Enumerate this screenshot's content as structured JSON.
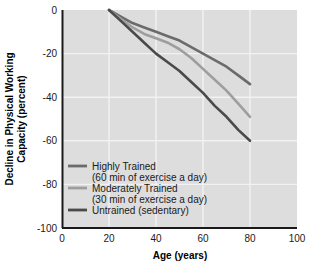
{
  "chart_data": {
    "type": "line",
    "title": "",
    "xlabel": "Age (years)",
    "ylabel": "Decline in Physical Working Capacity (percent)",
    "ylabel_line1": "Decline in Physical Working",
    "ylabel_line2": "Capacity (percent)",
    "xlim": [
      0,
      100
    ],
    "ylim": [
      -100,
      0
    ],
    "xticks": [
      "0",
      "20",
      "40",
      "60",
      "80",
      "100"
    ],
    "yticks": [
      "0",
      "-20",
      "-40",
      "-60",
      "-80",
      "-100"
    ],
    "grid": "white gridlines on gray panel",
    "legend_position": "inside lower left",
    "panel_color": "#dddddd",
    "gridline_color": "#f5f5f5",
    "axis_color": "#1a1a1a",
    "series": [
      {
        "name": "Highly Trained",
        "sublabel": "(60 min of exercise a day)",
        "color": "#6b6b6b",
        "x": [
          20,
          25,
          30,
          35,
          40,
          45,
          50,
          55,
          60,
          65,
          70,
          75,
          80
        ],
        "values": [
          0,
          -3,
          -6,
          -8,
          -10,
          -12,
          -14,
          -17,
          -20,
          -23,
          -26,
          -30,
          -34
        ]
      },
      {
        "name": "Moderately Trained",
        "sublabel": "(30 min of exercise a day)",
        "color": "#9e9e9e",
        "x": [
          20,
          25,
          30,
          35,
          40,
          45,
          50,
          55,
          60,
          65,
          70,
          75,
          80
        ],
        "values": [
          0,
          -4,
          -8,
          -11,
          -13,
          -15,
          -18,
          -22,
          -27,
          -32,
          -37,
          -43,
          -49
        ]
      },
      {
        "name": "Untrained (sedentary)",
        "sublabel": "",
        "color": "#4a4a4a",
        "x": [
          20,
          25,
          30,
          35,
          40,
          45,
          50,
          55,
          60,
          65,
          70,
          75,
          80
        ],
        "values": [
          0,
          -5,
          -10,
          -15,
          -20,
          -24,
          -28,
          -33,
          -38,
          -44,
          -49,
          -55,
          -60
        ]
      }
    ],
    "legend_entries": [
      {
        "label": "Highly Trained",
        "sublabel": "(60 min of exercise a day)",
        "color": "#6b6b6b"
      },
      {
        "label": "Moderately Trained",
        "sublabel": "(30 min of exercise a day)",
        "color": "#9e9e9e"
      },
      {
        "label": "Untrained (sedentary)",
        "sublabel": "",
        "color": "#4a4a4a"
      }
    ]
  }
}
